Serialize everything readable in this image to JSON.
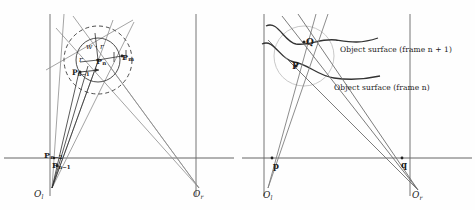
{
  "figure": {
    "type": "stereo-vision-geometry-diagram",
    "panels": [
      "left-prediction-panel",
      "right-surface-panel"
    ],
    "ink_color": "#2b2b2b",
    "ray_color": "#8c8c8c",
    "axis_color": "#555555",
    "curve_color": "#333333",
    "circle_color": "#b9b9b9"
  },
  "left_panel": {
    "name": "prediction-uncertainty-panel",
    "camera_left_label": "O",
    "camera_left_sub": "l",
    "camera_right_label": "O",
    "camera_right_sub": "r",
    "point_current": "P",
    "point_current_sub": "n",
    "point_prev1": "P",
    "point_prev1_sub": "n−1",
    "point_prev2": "P",
    "point_prev2_sub": "n−2",
    "point_match": "P",
    "point_match_sub": "m",
    "radius_label": "r",
    "outer_radius_label": "w · r",
    "image_plane_left": "left-image-plane",
    "image_plane_right": "right-image-plane",
    "baseline": "baseline-axis",
    "inner_circle": "search-radius-circle",
    "outer_circle": "predicted-uncertainty-circle"
  },
  "right_panel": {
    "name": "object-surface-panel",
    "camera_left_label": "O",
    "camera_left_sub": "l",
    "camera_right_label": "O",
    "camera_right_sub": "r",
    "point_p3d": "P",
    "point_q3d": "Q",
    "image_point_left": "p",
    "image_point_right": "q",
    "surface_upper": "Object surface (frame n + 1)",
    "surface_lower": "Object surface (frame n)",
    "neighbourhood_circle": "surface-neighbourhood-circle"
  }
}
